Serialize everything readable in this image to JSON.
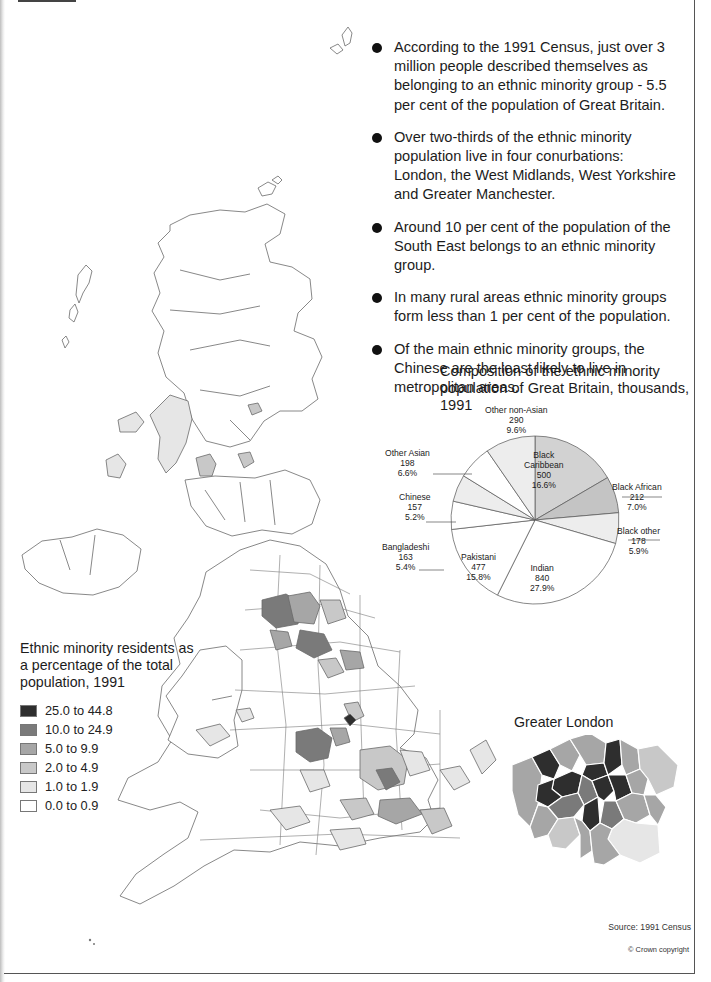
{
  "bullets": [
    "According to the 1991 Census, just over 3 million people described themselves as belonging to an ethnic minority group - 5.5 per cent of the population of Great Britain.",
    "Over two-thirds of the ethnic minority population live in four conurbations: London, the West Midlands, West Yorkshire and Greater Manchester.",
    "Around 10 per cent of the population of the South East belongs to an ethnic minority group.",
    "In many rural areas ethnic minority groups form less than 1 per cent of the population.",
    "Of the main ethnic minority groups, the Chinese are the least likely to live in metropolitan areas."
  ],
  "pie": {
    "title": "Composition of the ethnic minority population of Great Britain, thousands, 1991",
    "labels": {
      "black_caribbean": [
        "Black",
        "Caribbean",
        "500",
        "16.6%"
      ],
      "black_african": [
        "Black African",
        "212",
        "7.0%"
      ],
      "black_other": [
        "Black other",
        "178",
        "5.9%"
      ],
      "indian": [
        "Indian",
        "840",
        "27.9%"
      ],
      "pakistani": [
        "Pakistani",
        "477",
        "15.8%"
      ],
      "bangladeshi": [
        "Bangladeshi",
        "163",
        "5.4%"
      ],
      "chinese": [
        "Chinese",
        "157",
        "5.2%"
      ],
      "other_asian": [
        "Other Asian",
        "198",
        "6.6%"
      ],
      "other_non_asian": [
        "Other non-Asian",
        "290",
        "9.6%"
      ]
    }
  },
  "chart_data": {
    "type": "pie",
    "title": "Composition of the ethnic minority population of Great Britain, thousands, 1991",
    "categories": [
      "Black Caribbean",
      "Black African",
      "Black other",
      "Indian",
      "Pakistani",
      "Bangladeshi",
      "Chinese",
      "Other Asian",
      "Other non-Asian"
    ],
    "values": [
      500,
      212,
      178,
      840,
      477,
      163,
      157,
      198,
      290
    ],
    "percentages": [
      16.6,
      7.0,
      5.9,
      27.9,
      15.8,
      5.4,
      5.2,
      6.6,
      9.6
    ],
    "fills": [
      "#d2d2d2",
      "#c4c4c4",
      "#ededed",
      "#ffffff",
      "#ffffff",
      "#ffffff",
      "#ededed",
      "#ffffff",
      "#ededed"
    ],
    "start": "12 o'clock, clockwise",
    "unit": "thousands"
  },
  "legend": {
    "title": "Ethnic minority residents as a percentage of the total population, 1991",
    "classes": [
      {
        "label": "25.0 to 44.8",
        "color": "#2e2e2e"
      },
      {
        "label": "10.0 to 24.9",
        "color": "#7a7a7a"
      },
      {
        "label": "5.0 to 9.9",
        "color": "#a6a6a6"
      },
      {
        "label": "2.0 to 4.9",
        "color": "#c8c8c8"
      },
      {
        "label": "1.0 to 1.9",
        "color": "#e6e6e6"
      },
      {
        "label": "0.0 to 0.9",
        "color": "#ffffff"
      }
    ]
  },
  "london": {
    "title": "Greater London"
  },
  "footer": {
    "source": "Source: 1991 Census",
    "copyright": "© Crown copyright"
  }
}
